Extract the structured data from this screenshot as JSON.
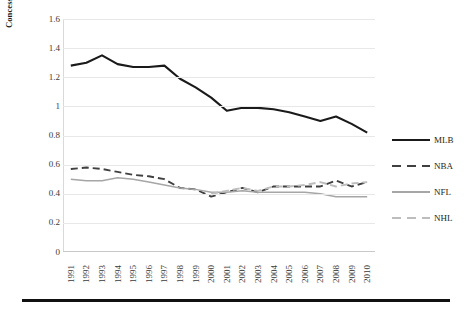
{
  "axes": {
    "ylabel": "Concession prices/ticket prices",
    "yticks": [
      "0",
      "0.2",
      "0.4",
      "0.6",
      "0.8",
      "1",
      "1.2",
      "1.4",
      "1.6"
    ],
    "xticks": [
      "1991",
      "1992",
      "1993",
      "1994",
      "1995",
      "1996",
      "1997",
      "1998",
      "1999",
      "2000",
      "2001",
      "2002",
      "2003",
      "2004",
      "2005",
      "2006",
      "2007",
      "2008",
      "2009",
      "2010"
    ]
  },
  "legend": [
    {
      "label": "MLB",
      "style": "solid-dark",
      "color": "#1a1a1a"
    },
    {
      "label": "NBA",
      "style": "dash-dark",
      "color": "#404040"
    },
    {
      "label": "NFL",
      "style": "solid-gray",
      "color": "#a6a6a6"
    },
    {
      "label": "NHL",
      "style": "dash-gray",
      "color": "#bdbdbd"
    }
  ],
  "chart_data": {
    "type": "line",
    "title": "",
    "xlabel": "",
    "ylabel": "Concession prices/ticket prices",
    "x": [
      1991,
      1992,
      1993,
      1994,
      1995,
      1996,
      1997,
      1998,
      1999,
      2000,
      2001,
      2002,
      2003,
      2004,
      2005,
      2006,
      2007,
      2008,
      2009,
      2010
    ],
    "ylim": [
      0,
      1.6
    ],
    "ytick_step": 0.2,
    "grid": true,
    "legend_position": "right",
    "series": [
      {
        "name": "MLB",
        "color": "#1a1a1a",
        "dash": "solid",
        "values": [
          1.28,
          1.3,
          1.35,
          1.29,
          1.27,
          1.27,
          1.28,
          1.19,
          1.13,
          1.06,
          0.97,
          0.99,
          0.99,
          0.98,
          0.96,
          0.93,
          0.9,
          0.93,
          0.88,
          0.82
        ]
      },
      {
        "name": "NBA",
        "color": "#404040",
        "dash": "dashed",
        "values": [
          0.57,
          0.58,
          0.57,
          0.55,
          0.53,
          0.52,
          0.5,
          0.44,
          0.43,
          0.38,
          0.41,
          0.44,
          0.41,
          0.45,
          0.45,
          0.45,
          0.45,
          0.49,
          0.45,
          0.48
        ]
      },
      {
        "name": "NFL",
        "color": "#a6a6a6",
        "dash": "solid",
        "values": [
          0.5,
          0.49,
          0.49,
          0.51,
          0.5,
          0.48,
          0.46,
          0.44,
          0.43,
          0.41,
          0.41,
          0.42,
          0.41,
          0.41,
          0.41,
          0.41,
          0.4,
          0.38,
          0.38,
          0.38
        ]
      },
      {
        "name": "NHL",
        "color": "#bdbdbd",
        "dash": "dashed",
        "values": [
          null,
          null,
          null,
          null,
          null,
          null,
          null,
          null,
          null,
          0.4,
          0.42,
          0.44,
          0.42,
          0.45,
          0.45,
          0.46,
          0.48,
          0.45,
          0.47,
          0.48
        ]
      }
    ]
  }
}
